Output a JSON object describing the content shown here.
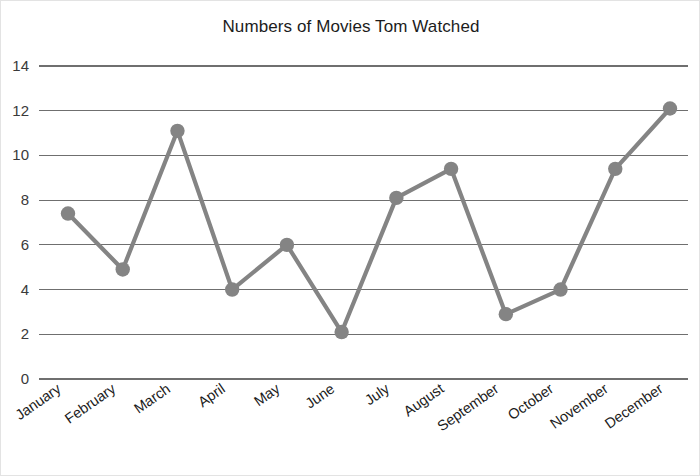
{
  "chart_data": {
    "type": "line",
    "title": "Numbers of Movies Tom Watched",
    "xlabel": "",
    "ylabel": "",
    "categories": [
      "January",
      "February",
      "March",
      "April",
      "May",
      "June",
      "July",
      "August",
      "September",
      "October",
      "November",
      "December"
    ],
    "values": [
      7.4,
      4.9,
      11.1,
      4.0,
      6.0,
      2.1,
      8.1,
      9.4,
      2.9,
      4.0,
      9.4,
      12.1
    ],
    "series": [
      {
        "name": "Movies Watched",
        "values": [
          7.4,
          4.9,
          11.1,
          4.0,
          6.0,
          2.1,
          8.1,
          9.4,
          2.9,
          4.0,
          9.4,
          12.1
        ]
      }
    ],
    "ylim": [
      0,
      14
    ],
    "yticks": [
      0,
      2,
      4,
      6,
      8,
      10,
      12,
      14
    ],
    "ytick_labels": [
      "0",
      "2",
      "4",
      "6",
      "8",
      "10",
      "12",
      "14"
    ],
    "grid": true,
    "grid_axis": "y",
    "legend": false,
    "legend_position": "none",
    "marker": "circle",
    "xtick_rotation": -35,
    "colors": {
      "line": "#848484",
      "marker": "#848484",
      "grid": "#6f6f6f",
      "axis": "#6f6f6f",
      "title_text": "#1c1c1c",
      "tick_text": "#1c1c1c",
      "background": "#ffffff",
      "border": "#e3e3e3"
    }
  }
}
